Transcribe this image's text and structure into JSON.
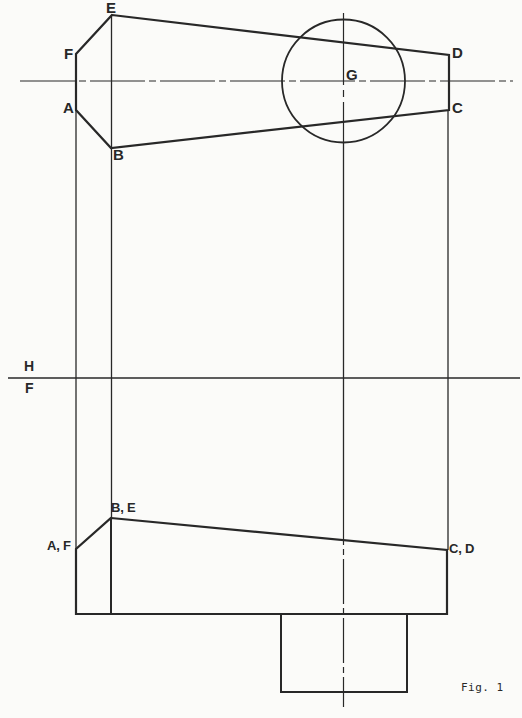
{
  "figure_caption": "Fig. 1",
  "top_view": {
    "description": "plan view of truncated hexagonal solid with circle",
    "point_labels": {
      "e": "E",
      "f": "F",
      "a": "A",
      "b": "B",
      "g": "G",
      "d": "D",
      "c": "C"
    }
  },
  "fold_line": {
    "above_label": "H",
    "below_label": "F"
  },
  "front_view": {
    "description": "elevation view with base pedestal",
    "point_labels": {
      "be": "B, E",
      "af": "A, F",
      "cd": "C, D"
    }
  },
  "colors": {
    "ink": "#282828",
    "paper": "#fbfbf9"
  }
}
